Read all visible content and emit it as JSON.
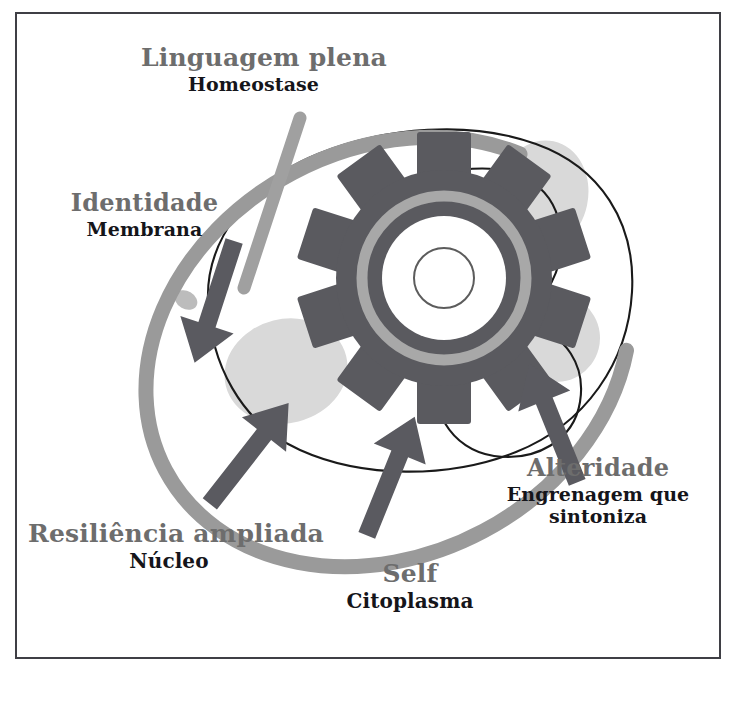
{
  "diagram": {
    "title_text": "",
    "colors": {
      "frame_border": "#3f3f45",
      "background": "#ffffff",
      "membrane_ring": "#9a9a9a",
      "pointer_line": "#a0a0a0",
      "gear_body": "#5a5a5f",
      "gear_inner_ring": "#a8a8a8",
      "arrow": "#5a5a60",
      "organelle_blob": "#d9d9d9",
      "cell_outline": "#1a1a1a",
      "label_main_color": "#6d6d6d",
      "label_sub_color": "#15151a"
    },
    "labels": [
      {
        "id": "linguagem",
        "main": "Linguagem plena",
        "sub": "Homeostase",
        "points_to": "membrane-pointer-line"
      },
      {
        "id": "identidade",
        "main": "Identidade",
        "sub": "Membrana",
        "points_to": "cell-membrane"
      },
      {
        "id": "resiliencia",
        "main": "Resiliência ampliada",
        "sub": "Núcleo",
        "points_to": "nucleus-blob"
      },
      {
        "id": "self",
        "main": "Self",
        "sub": "Citoplasma",
        "points_to": "cytoplasm"
      },
      {
        "id": "alteridade",
        "main": "Alteridade",
        "sub_line1": "Engrenagem que",
        "sub_line2": "sintoniza",
        "points_to": "gear"
      }
    ],
    "icons": {
      "gear": "gear-icon",
      "cell": "cell-icon",
      "arrows": "arrow-icon"
    }
  }
}
